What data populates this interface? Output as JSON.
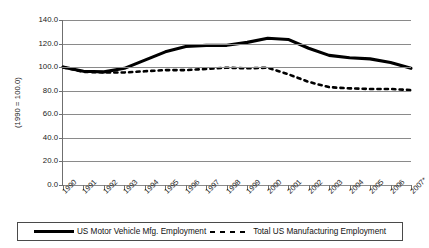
{
  "chart_data": {
    "type": "line",
    "title": "",
    "xlabel": "",
    "ylabel": "(1990 = 100.0)",
    "ylim": [
      0.0,
      140.0
    ],
    "ytick_step": 20.0,
    "grid": true,
    "legend_position": "bottom",
    "categories": [
      "1990",
      "1991",
      "1992",
      "1993",
      "1994",
      "1995",
      "1996",
      "1997",
      "1998",
      "1999",
      "2000",
      "2001",
      "2002",
      "2003",
      "2004",
      "2005",
      "2006",
      "2007*"
    ],
    "yticks": [
      "0.0",
      "20.0",
      "40.0",
      "60.0",
      "80.0",
      "100.0",
      "120.0",
      "140.0"
    ],
    "series": [
      {
        "name": "US Motor Vehicle Mfg. Employment",
        "style": "solid",
        "color": "#000000",
        "values": [
          100.0,
          96.5,
          96.0,
          99.0,
          106.0,
          113.0,
          117.5,
          118.5,
          118.5,
          121.0,
          124.5,
          123.5,
          116.0,
          110.0,
          108.0,
          107.0,
          104.0,
          99.0
        ]
      },
      {
        "name": "Total US Manufacturing Employment",
        "style": "dashed",
        "color": "#000000",
        "values": [
          100.0,
          96.0,
          95.5,
          95.5,
          96.5,
          97.5,
          97.5,
          98.5,
          99.5,
          99.0,
          99.5,
          94.0,
          87.5,
          83.0,
          82.0,
          81.5,
          81.5,
          80.5
        ]
      }
    ]
  },
  "legend": {
    "entries": [
      {
        "label": "US Motor Vehicle Mfg. Employment",
        "style": "solid"
      },
      {
        "label": "Total US Manufacturing Employment",
        "style": "dashed"
      }
    ]
  }
}
